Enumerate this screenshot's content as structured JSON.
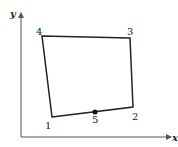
{
  "diagram": {
    "axes": {
      "x_label": "x",
      "y_label": "y",
      "color": "#555555"
    },
    "element": {
      "edge_color": "#222222",
      "nodes": [
        {
          "id": "1",
          "label": "1",
          "x": 52,
          "y": 117
        },
        {
          "id": "2",
          "label": "2",
          "x": 133,
          "y": 107
        },
        {
          "id": "3",
          "label": "3",
          "x": 130,
          "y": 38
        },
        {
          "id": "4",
          "label": "4",
          "x": 42,
          "y": 36
        },
        {
          "id": "5",
          "label": "5",
          "x": 95,
          "y": 112,
          "marked": true
        }
      ]
    }
  }
}
